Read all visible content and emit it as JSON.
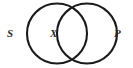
{
  "figure": {
    "kind": "venn-diagram",
    "background_color": "#ffffff",
    "stroke_color": "#1a1a1a",
    "label_color": "#2b2b2b"
  },
  "circles": {
    "subject": {
      "name": "left-circle",
      "cx": 57,
      "cy": 33.5,
      "r": 30
    },
    "predicate": {
      "name": "right-circle",
      "cx": 87,
      "cy": 33.5,
      "r": 30
    }
  },
  "labels": {
    "left": "S",
    "middle": "X",
    "right": "P"
  },
  "chart_data": {
    "type": "diagram",
    "title": "",
    "sets": [
      {
        "name": "S",
        "label": "S",
        "position": "left-outside"
      },
      {
        "name": "P",
        "label": "P",
        "position": "right-outside"
      }
    ],
    "annotations": [
      {
        "text": "S",
        "x": 11,
        "y": 34
      },
      {
        "text": "X",
        "x": 54,
        "y": 34
      },
      {
        "text": "P",
        "x": 118,
        "y": 34
      }
    ]
  }
}
